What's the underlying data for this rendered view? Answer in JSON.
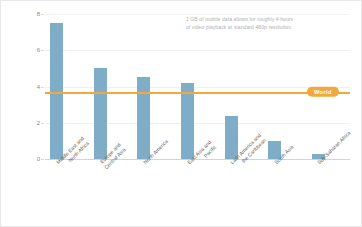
{
  "chart_data": {
    "type": "bar",
    "title": "",
    "subtitle": "",
    "xlabel": "",
    "ylabel": "Data consumption (GB per capita per month)",
    "ylim": [
      0,
      8
    ],
    "yticks": [
      0,
      2,
      4,
      6,
      8
    ],
    "ytick_labels": [
      "0",
      "2",
      "4",
      "6",
      "8"
    ],
    "grid": true,
    "grid_axis": "y",
    "legend": false,
    "bar_color": "#7fadc8",
    "categories": [
      "Middle East and North Africa",
      "Europe and Central Asia",
      "North America",
      "East Asia and Pacific",
      "Latin America and the Caribbean",
      "South Asia",
      "Sub-Saharan Africa"
    ],
    "category_lines": [
      [
        "Middle East and",
        "North Africa"
      ],
      [
        "Europe and",
        "Central Asia"
      ],
      [
        "North America"
      ],
      [
        "East Asia and",
        "Pacific"
      ],
      [
        "Latin America and",
        "the Caribbean"
      ],
      [
        "South Asia"
      ],
      [
        "Sub-Saharan Africa"
      ]
    ],
    "values": [
      7.5,
      5.0,
      4.5,
      4.2,
      2.4,
      1.0,
      0.25
    ],
    "reference_line": {
      "label": "World",
      "value": 3.7,
      "color": "#f2a93b"
    },
    "annotations": [
      "1 GB of mobile data allows for roughly 4 hours",
      "of video playback at standard 480p resolution"
    ]
  }
}
